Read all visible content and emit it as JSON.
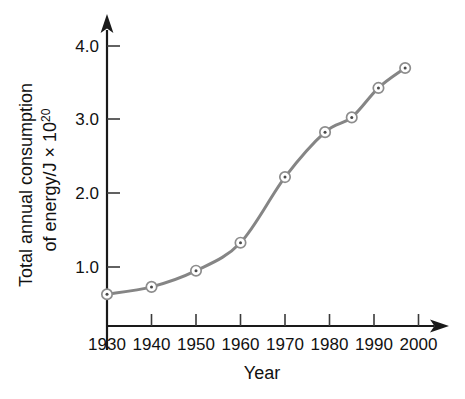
{
  "chart_data": {
    "type": "line",
    "title": "",
    "xlabel": "Year",
    "ylabel_line1": "Total annual consumption",
    "ylabel_line2": "of energy/J × 10",
    "ylabel_exponent": "20",
    "ylabel": "Total annual consumption of energy/J × 10²⁰",
    "x": [
      1930,
      1940,
      1950,
      1960,
      1970,
      1979,
      1985,
      1991,
      1997
    ],
    "values": [
      0.63,
      0.73,
      0.95,
      1.33,
      2.22,
      2.83,
      3.03,
      3.43,
      3.7
    ],
    "series": [
      {
        "name": "Total annual consumption of energy",
        "values": [
          0.63,
          0.73,
          0.95,
          1.33,
          2.22,
          2.83,
          3.03,
          3.43,
          3.7
        ]
      }
    ],
    "xlim": [
      1930,
      2000
    ],
    "ylim": [
      0.0,
      4.3
    ],
    "xticks": [
      1930,
      1940,
      1950,
      1960,
      1970,
      1980,
      1990,
      2000
    ],
    "xtick_labels": [
      "1930",
      "1940",
      "1950",
      "1960",
      "1970",
      "1980",
      "1990",
      "2000"
    ],
    "yticks": [
      1.0,
      2.0,
      3.0,
      4.0
    ],
    "ytick_labels": [
      "1.0",
      "2.0",
      "3.0",
      "4.0"
    ],
    "grid": false,
    "legend": false,
    "legend_position": "none",
    "marker": "circle-with-center-dot",
    "line_color": "#858585",
    "marker_edge_color": "#8d8d8d",
    "marker_face_color": "#ffffff",
    "marker_dot_color": "#4a4a4a",
    "axis_color": "#1a1a1a",
    "background_color": "#ffffff",
    "axis_style": "arrow-ended"
  }
}
